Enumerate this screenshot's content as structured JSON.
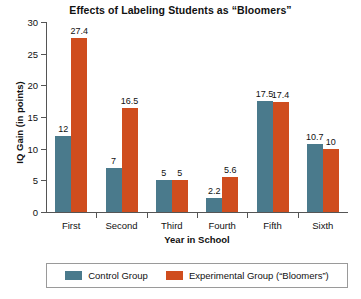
{
  "chart_data": {
    "type": "bar",
    "title": "Effects of Labeling Students as “Bloomers”",
    "xlabel": "Year in School",
    "ylabel": "IQ Gain (in points)",
    "categories": [
      "First",
      "Second",
      "Third",
      "Fourth",
      "Fifth",
      "Sixth"
    ],
    "series": [
      {
        "name": "Control Group",
        "color": "#4a7a8c",
        "values": [
          12,
          7,
          5,
          2.2,
          17.5,
          10.7
        ],
        "labels": [
          "12",
          "7",
          "5",
          "2.2",
          "17.5",
          "10.7"
        ]
      },
      {
        "name": "Experimental Group (“Bloomers”)",
        "color": "#cf4d1e",
        "values": [
          27.4,
          16.5,
          5,
          5.6,
          17.4,
          10
        ],
        "labels": [
          "27.4",
          "16.5",
          "5",
          "5.6",
          "17.4",
          "10"
        ]
      }
    ],
    "ylim": [
      0,
      30
    ],
    "yticks": [
      0,
      5,
      10,
      15,
      20,
      25,
      30
    ],
    "ytick_labels": [
      "0",
      "5",
      "10",
      "15",
      "20",
      "25",
      "30"
    ],
    "grid": false,
    "legend_position": "bottom"
  }
}
